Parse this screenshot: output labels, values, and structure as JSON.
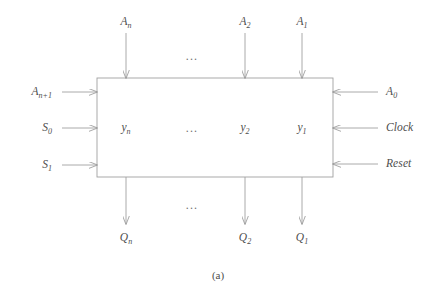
{
  "figure": {
    "caption": "(a)",
    "stroke_color": "#a0a0a0",
    "text_color": "#4d4d4d",
    "background_color": "#ffffff",
    "block_label": ""
  },
  "top_inputs": [
    {
      "base": "A",
      "sub": "n",
      "x": 126
    },
    {
      "base": "A",
      "sub": "2",
      "x": 245
    },
    {
      "base": "A",
      "sub": "1",
      "x": 302
    }
  ],
  "left_inputs": [
    {
      "base": "A",
      "sub": "n+1",
      "y": 92
    },
    {
      "base": "S",
      "sub": "0",
      "y": 128
    },
    {
      "base": "S",
      "sub": "1",
      "y": 165
    }
  ],
  "right_inputs": [
    {
      "base": "A",
      "sub": "0",
      "y": 92
    },
    {
      "base": "Clock",
      "sub": "",
      "y": 128
    },
    {
      "base": "Reset",
      "sub": "",
      "y": 164
    }
  ],
  "internal_labels": [
    {
      "base": "y",
      "sub": "n",
      "x": 126
    },
    {
      "base": "y",
      "sub": "2",
      "x": 245
    },
    {
      "base": "y",
      "sub": "1",
      "x": 302
    }
  ],
  "bottom_outputs": [
    {
      "base": "Q",
      "sub": "n",
      "x": 126
    },
    {
      "base": "Q",
      "sub": "2",
      "x": 245
    },
    {
      "base": "Q",
      "sub": "1",
      "x": 302
    }
  ],
  "ellipses": [
    {
      "text": "...",
      "x": 192,
      "y": 56
    },
    {
      "text": "...",
      "x": 192,
      "y": 128
    },
    {
      "text": "...",
      "x": 192,
      "y": 205
    }
  ]
}
